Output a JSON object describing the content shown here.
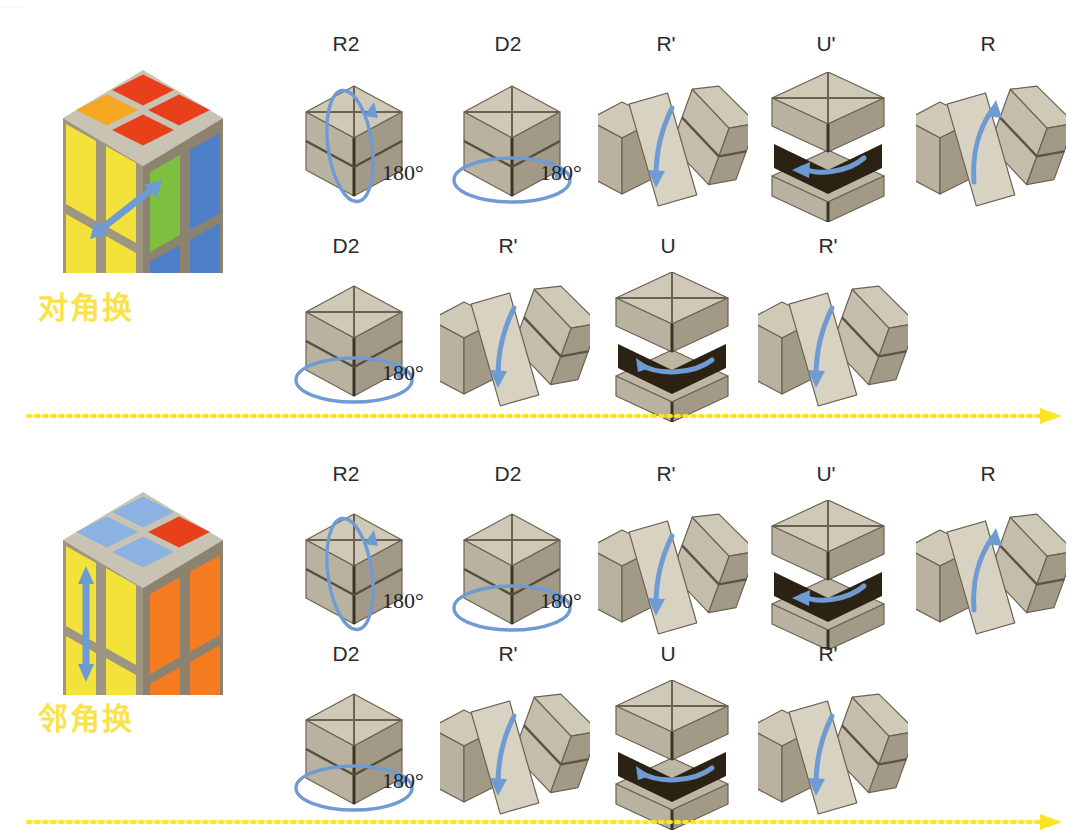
{
  "page": {
    "width": 1074,
    "height": 836,
    "background": "#ffffff",
    "top_cut_text": "……"
  },
  "colors": {
    "label_yellow": "#FAE24A",
    "flow_arrow_yellow": "#FCE425",
    "cube_grey_top": "#CFC9B8",
    "cube_grey_left": "#B9B2A0",
    "cube_grey_right": "#A29A87",
    "cube_dark_gap": "#2B2214",
    "arrow_blue": "#6E9BD4",
    "sticker_red": "#E8401A",
    "sticker_orange": "#F5A623",
    "sticker_yellow": "#F2E23A",
    "sticker_blue": "#4E7FC9",
    "sticker_lightblue": "#8BB2E3",
    "sticker_green": "#7FBF3F",
    "sticker_darkorange": "#F57B20",
    "text_dark": "#2b2b2b"
  },
  "sections": [
    {
      "id": "diagonal-swap",
      "label": "对角换",
      "label_pos": {
        "x": 38,
        "y": 283
      },
      "top": 0,
      "preview_cube": {
        "name": "preview-cube-diagonal",
        "pos": {
          "x": 38,
          "y": 48
        },
        "arrow": "diagonal-double-arrow",
        "faces": {
          "top": [
            "red",
            "red",
            "red",
            "orange"
          ],
          "left": [
            "yellow",
            "yellow",
            "yellow",
            "yellow"
          ],
          "right": [
            "green",
            "blue",
            "blue",
            "blue"
          ]
        }
      },
      "rows": [
        {
          "label_y": 32,
          "cube_y": 72,
          "steps": [
            {
              "move": "R2",
              "label_x": 346,
              "cube_x": 282,
              "type": "rotate-vertical-180",
              "degree_text": "180°",
              "degree_pos": {
                "x": 100,
                "y": 88
              }
            },
            {
              "move": "D2",
              "label_x": 508,
              "cube_x": 440,
              "type": "rotate-horizontal-180",
              "degree_text": "180°",
              "degree_pos": {
                "x": 100,
                "y": 88
              }
            },
            {
              "move": "R'",
              "label_x": 666,
              "cube_x": 598,
              "type": "twist-r-down",
              "degree_text": "",
              "degree_pos": {
                "x": 0,
                "y": 0
              }
            },
            {
              "move": "U'",
              "label_x": 826,
              "cube_x": 756,
              "type": "split-u-left",
              "degree_text": "",
              "degree_pos": {
                "x": 0,
                "y": 0
              }
            },
            {
              "move": "R",
              "label_x": 988,
              "cube_x": 916,
              "type": "twist-r-up",
              "degree_text": "",
              "degree_pos": {
                "x": 0,
                "y": 0
              }
            }
          ]
        },
        {
          "label_y": 234,
          "cube_y": 272,
          "steps": [
            {
              "move": "D2",
              "label_x": 346,
              "cube_x": 282,
              "type": "rotate-horizontal-180",
              "degree_text": "180°",
              "degree_pos": {
                "x": 100,
                "y": 88
              }
            },
            {
              "move": "R'",
              "label_x": 508,
              "cube_x": 440,
              "type": "twist-r-down",
              "degree_text": "",
              "degree_pos": {
                "x": 0,
                "y": 0
              }
            },
            {
              "move": "U",
              "label_x": 668,
              "cube_x": 600,
              "type": "split-u-right",
              "degree_text": "",
              "degree_pos": {
                "x": 0,
                "y": 0
              }
            },
            {
              "move": "R'",
              "label_x": 828,
              "cube_x": 758,
              "type": "twist-r-down",
              "degree_text": "",
              "degree_pos": {
                "x": 0,
                "y": 0
              }
            }
          ]
        }
      ],
      "flow_arrow_y": 406
    },
    {
      "id": "adjacent-swap",
      "label": "邻角换",
      "label_pos": {
        "x": 38,
        "y": 694
      },
      "top": 430,
      "preview_cube": {
        "name": "preview-cube-adjacent",
        "pos": {
          "x": 38,
          "y": 470
        },
        "arrow": "vertical-double-arrow",
        "faces": {
          "top": [
            "lightblue",
            "red",
            "lightblue",
            "lightblue"
          ],
          "left": [
            "yellow",
            "yellow",
            "yellow",
            "yellow"
          ],
          "right": [
            "darkorange",
            "darkorange",
            "darkorange",
            "darkorange"
          ]
        }
      },
      "rows": [
        {
          "label_y": 462,
          "cube_y": 500,
          "steps": [
            {
              "move": "R2",
              "label_x": 346,
              "cube_x": 282,
              "type": "rotate-vertical-180",
              "degree_text": "180°",
              "degree_pos": {
                "x": 100,
                "y": 88
              }
            },
            {
              "move": "D2",
              "label_x": 508,
              "cube_x": 440,
              "type": "rotate-horizontal-180",
              "degree_text": "180°",
              "degree_pos": {
                "x": 100,
                "y": 88
              }
            },
            {
              "move": "R'",
              "label_x": 666,
              "cube_x": 598,
              "type": "twist-r-down",
              "degree_text": "",
              "degree_pos": {
                "x": 0,
                "y": 0
              }
            },
            {
              "move": "U'",
              "label_x": 826,
              "cube_x": 756,
              "type": "split-u-left",
              "degree_text": "",
              "degree_pos": {
                "x": 0,
                "y": 0
              }
            },
            {
              "move": "R",
              "label_x": 988,
              "cube_x": 916,
              "type": "twist-r-up",
              "degree_text": "",
              "degree_pos": {
                "x": 0,
                "y": 0
              }
            }
          ]
        },
        {
          "label_y": 642,
          "cube_y": 680,
          "steps": [
            {
              "move": "D2",
              "label_x": 346,
              "cube_x": 282,
              "type": "rotate-horizontal-180",
              "degree_text": "180°",
              "degree_pos": {
                "x": 100,
                "y": 88
              }
            },
            {
              "move": "R'",
              "label_x": 508,
              "cube_x": 440,
              "type": "twist-r-down",
              "degree_text": "",
              "degree_pos": {
                "x": 0,
                "y": 0
              }
            },
            {
              "move": "U",
              "label_x": 668,
              "cube_x": 600,
              "type": "split-u-right",
              "degree_text": "",
              "degree_pos": {
                "x": 0,
                "y": 0
              }
            },
            {
              "move": "R'",
              "label_x": 828,
              "cube_x": 758,
              "type": "twist-r-down",
              "degree_text": "",
              "degree_pos": {
                "x": 0,
                "y": 0
              }
            }
          ]
        }
      ],
      "flow_arrow_y": 812
    }
  ]
}
